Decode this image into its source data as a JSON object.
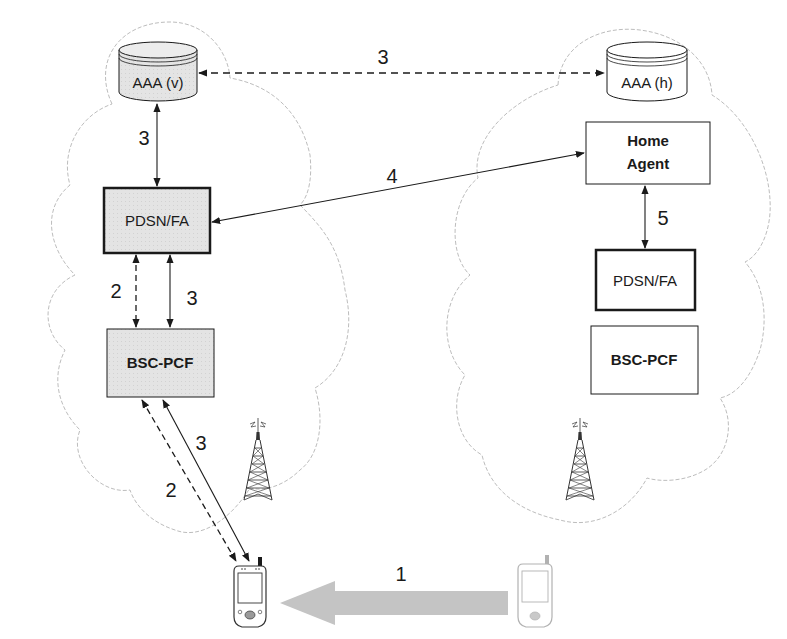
{
  "diagram": {
    "type": "mobile-ip-handoff-network",
    "networks": [
      {
        "id": "visited",
        "name": "visited-network-cloud"
      },
      {
        "id": "home",
        "name": "home-network-cloud"
      }
    ],
    "nodes": {
      "aaa_v": {
        "label": "AAA (v)",
        "shape": "cylinder",
        "fill": "#e6e6e6"
      },
      "aaa_h": {
        "label": "AAA (h)",
        "shape": "cylinder",
        "fill": "#ffffff"
      },
      "pdsn_fa_v": {
        "label": "PDSN/FA",
        "shape": "box-thick",
        "fill": "#e6e6e6"
      },
      "bsc_pcf_v": {
        "label": "BSC-PCF",
        "shape": "box",
        "fill": "#e6e6e6"
      },
      "home_agent": {
        "label_line1": "Home",
        "label_line2": "Agent",
        "shape": "box",
        "fill": "#ffffff"
      },
      "pdsn_fa_h": {
        "label": "PDSN/FA",
        "shape": "box-thick",
        "fill": "#ffffff"
      },
      "bsc_pcf_h": {
        "label": "BSC-PCF",
        "shape": "box",
        "fill": "#ffffff"
      }
    },
    "edges": [
      {
        "from": "aaa_v",
        "to": "aaa_h",
        "label": "3",
        "style": "dashed",
        "bidirectional": true
      },
      {
        "from": "aaa_v",
        "to": "pdsn_fa_v",
        "label": "3",
        "style": "solid",
        "bidirectional": true
      },
      {
        "from": "pdsn_fa_v",
        "to": "home_agent",
        "label": "4",
        "style": "solid",
        "bidirectional": true
      },
      {
        "from": "home_agent",
        "to": "pdsn_fa_h",
        "label": "5",
        "style": "solid",
        "bidirectional": true
      },
      {
        "from": "pdsn_fa_v",
        "to": "bsc_pcf_v",
        "label": "2",
        "style": "dashed",
        "bidirectional": true
      },
      {
        "from": "pdsn_fa_v",
        "to": "bsc_pcf_v",
        "label": "3",
        "style": "solid",
        "bidirectional": true
      },
      {
        "from": "bsc_pcf_v",
        "to": "mobile_new",
        "label": "2",
        "style": "dashed",
        "bidirectional": true
      },
      {
        "from": "bsc_pcf_v",
        "to": "mobile_new",
        "label": "3",
        "style": "solid",
        "bidirectional": true
      },
      {
        "from": "mobile_old",
        "to": "mobile_new",
        "label": "1",
        "style": "thick-gray-arrow",
        "bidirectional": false
      }
    ],
    "labels": {
      "aaa_link": "3",
      "aaa_v_pdsn": "3",
      "pdsn_home_agent": "4",
      "home_agent_pdsn_h": "5",
      "pdsn_bsc_dashed": "2",
      "pdsn_bsc_solid": "3",
      "bsc_mobile_dashed": "2",
      "bsc_mobile_solid": "3",
      "movement": "1"
    },
    "icons": {
      "tower_visited": "radio-tower-icon",
      "tower_home": "radio-tower-icon",
      "mobile_new": "pda-device-icon",
      "mobile_old": "pda-device-faded-icon"
    },
    "colors": {
      "line": "#1a1a1a",
      "cloud_outline": "#bdbdbd",
      "gray_fill": "#e6e6e6",
      "move_arrow": "#c4c4c4"
    }
  }
}
